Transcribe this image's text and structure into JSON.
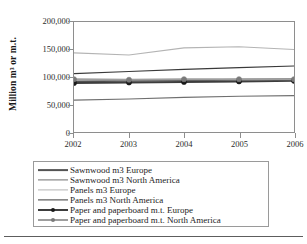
{
  "chart_data": {
    "type": "line",
    "title": "",
    "xlabel": "",
    "ylabel": "Million m³ or m.t.",
    "x": [
      2002,
      2003,
      2004,
      2005,
      2006
    ],
    "xtick_labels": [
      "2002",
      "2003",
      "2004",
      "2005",
      "2006"
    ],
    "ytick_labels": [
      "200,000",
      "150,000",
      "100,000",
      "50,000",
      "0"
    ],
    "ytick_values": [
      200000,
      150000,
      100000,
      50000,
      0
    ],
    "ylim": [
      0,
      200000
    ],
    "xlim": [
      2002,
      2006
    ],
    "grid": false,
    "legend_position": "below",
    "series": [
      {
        "name": "Sawnwood m3 Europe",
        "values": [
          92000,
          93000,
          94000,
          95000,
          96000
        ],
        "color": "#545454",
        "width": 1.8,
        "marker": "none"
      },
      {
        "name": "Sawnwood m3 North America",
        "values": [
          58000,
          60000,
          63000,
          65000,
          66000
        ],
        "color": "#6f6f6f",
        "width": 1.2,
        "marker": "none"
      },
      {
        "name": "Panels m3 Europe",
        "values": [
          144000,
          140000,
          153000,
          155000,
          150000
        ],
        "color": "#b4b4b4",
        "width": 1.2,
        "marker": "none"
      },
      {
        "name": "Panels m3 North America",
        "values": [
          106000,
          110000,
          114000,
          117000,
          120000
        ],
        "color": "#3a3a3a",
        "width": 1.2,
        "marker": "none"
      },
      {
        "name": "Paper and paperboard m.t. Europe",
        "values": [
          89000,
          90000,
          91000,
          92000,
          93000
        ],
        "color": "#3d3d3d",
        "width": 2.0,
        "marker": "circle",
        "marker_color": "#1a1a1a"
      },
      {
        "name": "Paper and paperboard m.t. North America",
        "values": [
          96000,
          95000,
          96000,
          96000,
          96000
        ],
        "color": "#9e9e9e",
        "width": 2.0,
        "marker": "circle",
        "marker_color": "#7a7a7a"
      }
    ]
  },
  "figure": {
    "frame_color": "#8e8e8e",
    "legend_border_color": "#9a9a9a",
    "rule_color": "#5d5d5d",
    "background": "#ffffff"
  }
}
